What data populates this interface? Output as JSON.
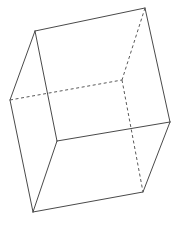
{
  "figure": {
    "name": "wireframe-cube",
    "type": "3d-wireframe-solid",
    "shape_label": "cube",
    "background_color": "#ffffff",
    "solid_edge_color": "#4a4a4a",
    "hidden_edge_color": "#5a5a5a",
    "edge_width": 1,
    "hidden_edge_style": "dashed",
    "canvas": {
      "width": 177,
      "height": 232
    },
    "vertices": {
      "top_back_left": {
        "x": 35,
        "y": 31
      },
      "top_back_right": {
        "x": 145,
        "y": 8
      },
      "top_front_left": {
        "x": 10,
        "y": 100
      },
      "top_front_right": {
        "x": 122,
        "y": 80
      },
      "bottom_back_left": {
        "x": 57,
        "y": 141
      },
      "bottom_back_right": {
        "x": 170,
        "y": 122
      },
      "bottom_front_left": {
        "x": 33,
        "y": 212
      },
      "bottom_front_right": {
        "x": 143,
        "y": 192
      }
    },
    "edges_visible": [
      [
        "top_back_left",
        "top_back_right"
      ],
      [
        "top_back_left",
        "top_front_left"
      ],
      [
        "top_back_left",
        "bottom_back_left"
      ],
      [
        "top_back_right",
        "bottom_back_right"
      ],
      [
        "top_front_left",
        "bottom_front_left"
      ],
      [
        "bottom_back_left",
        "bottom_back_right"
      ],
      [
        "bottom_back_left",
        "bottom_front_left"
      ],
      [
        "bottom_front_left",
        "bottom_front_right"
      ],
      [
        "bottom_front_right",
        "bottom_back_right"
      ]
    ],
    "edges_hidden": [
      [
        "top_front_left",
        "top_front_right"
      ],
      [
        "top_back_right",
        "top_front_right"
      ],
      [
        "top_front_right",
        "bottom_front_right"
      ]
    ]
  }
}
